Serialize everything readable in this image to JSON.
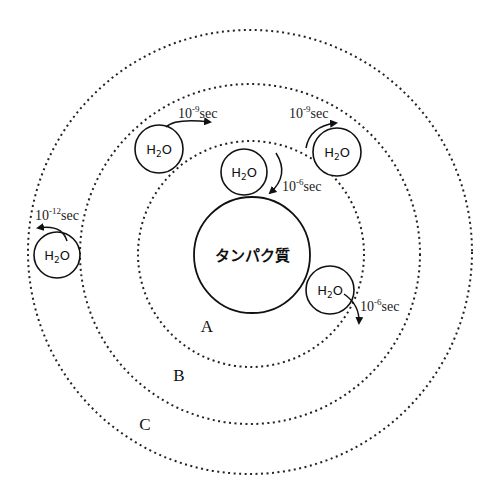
{
  "diagram": {
    "protein_label": "タンパク質",
    "regions": [
      {
        "label": "A"
      },
      {
        "label": "B"
      },
      {
        "label": "C"
      }
    ],
    "water_molecules": [
      {
        "label": "H2O",
        "label_main": "H",
        "label_sub": "2",
        "label_end": "O",
        "location": "inner-top",
        "time_base": "10",
        "time_exp": "-6",
        "time_unit": "sec"
      },
      {
        "label": "H2O",
        "label_main": "H",
        "label_sub": "2",
        "label_end": "O",
        "location": "inner-right",
        "time_base": "10",
        "time_exp": "-6",
        "time_unit": "sec"
      },
      {
        "label": "H2O",
        "label_main": "H",
        "label_sub": "2",
        "label_end": "O",
        "location": "middle-left",
        "time_base": "10",
        "time_exp": "-9",
        "time_unit": "sec"
      },
      {
        "label": "H2O",
        "label_main": "H",
        "label_sub": "2",
        "label_end": "O",
        "location": "middle-right",
        "time_base": "10",
        "time_exp": "-9",
        "time_unit": "sec"
      },
      {
        "label": "H2O",
        "label_main": "H",
        "label_sub": "2",
        "label_end": "O",
        "location": "outer-left",
        "time_base": "10",
        "time_exp": "-12",
        "time_unit": "sec"
      }
    ],
    "colors": {
      "stroke": "#111111",
      "background": "#ffffff"
    }
  }
}
